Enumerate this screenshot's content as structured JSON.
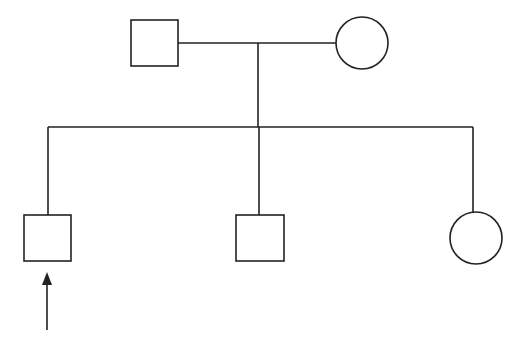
{
  "diagram": {
    "type": "pedigree",
    "generations": [
      {
        "label": "I",
        "individuals": [
          {
            "id": "father",
            "sex": "male",
            "shape": "square",
            "affected": false
          },
          {
            "id": "mother",
            "sex": "female",
            "shape": "circle",
            "affected": false
          }
        ]
      },
      {
        "label": "II",
        "individuals": [
          {
            "id": "son-1",
            "sex": "male",
            "shape": "square",
            "affected": false,
            "proband": true
          },
          {
            "id": "son-2",
            "sex": "male",
            "shape": "square",
            "affected": false
          },
          {
            "id": "daughter",
            "sex": "female",
            "shape": "circle",
            "affected": false
          }
        ]
      }
    ],
    "proband_marker": "arrow",
    "colors": {
      "stroke": "#222222",
      "fill": "#ffffff",
      "background": "#ffffff"
    }
  }
}
